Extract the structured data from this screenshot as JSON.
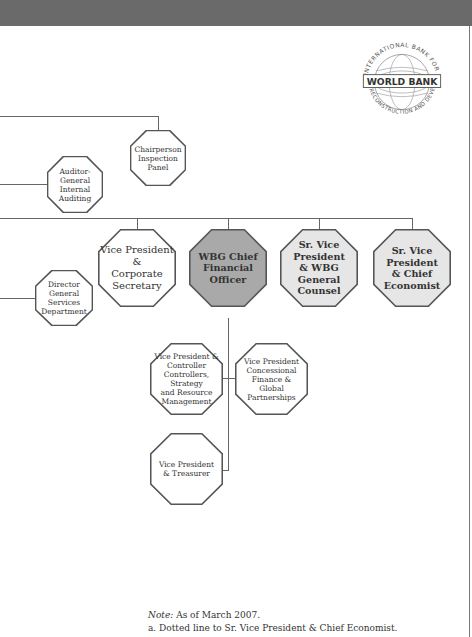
{
  "header": {
    "bar_color": "#6a6a6a"
  },
  "logo": {
    "name": "WORLD BANK",
    "ring_top": "INTERNATIONAL BANK FOR",
    "ring_bottom": "RECONSTRUCTION AND DEVELOPMENT"
  },
  "nodes": {
    "chairperson": "Chairperson Inspection Panel",
    "chairperson_lines": [
      "Chairperson",
      "Inspection",
      "Panel"
    ],
    "auditor_lines": [
      "Auditor-General",
      "Internal",
      "Auditing"
    ],
    "director_lines": [
      "Director",
      "General Services",
      "Department"
    ],
    "vp_corp_lines": [
      "Vice President &",
      "Corporate",
      "Secretary"
    ],
    "cfo_lines": [
      "WBG Chief",
      "Financial",
      "Officer"
    ],
    "counsel_lines": [
      "Sr. Vice President",
      "& WBG",
      "General Counsel"
    ],
    "economist_lines": [
      "Sr. Vice President",
      "& Chief",
      "Economist"
    ],
    "controller_lines": [
      "Vice President &",
      "Controller",
      "Controllers, Strategy",
      "and Resource",
      "Management"
    ],
    "concessional_lines": [
      "Vice President",
      "Concessional",
      "Finance &",
      "Global",
      "Partnerships"
    ],
    "treasurer_lines": [
      "Vice President",
      "& Treasurer"
    ]
  },
  "colors": {
    "cfo_fill": "#a9a9a9",
    "senior_fill": "#e6e6e6",
    "plain_fill": "#ffffff",
    "stroke": "#555555"
  },
  "notes": {
    "note_label": "Note:",
    "note_text": " As of March 2007.",
    "a": "a.  Dotted line to Sr. Vice President & Chief Economist."
  }
}
